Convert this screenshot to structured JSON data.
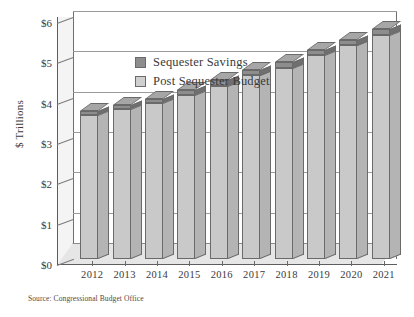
{
  "chart_data": {
    "type": "bar",
    "stacked": true,
    "title": "",
    "xlabel": "",
    "ylabel": "$ Trillions",
    "ylim": [
      0,
      6
    ],
    "ytick_values": [
      0,
      1,
      2,
      3,
      4,
      5,
      6
    ],
    "ytick_labels": [
      "$0",
      "$1",
      "$2",
      "$3",
      "$4",
      "$5",
      "$6"
    ],
    "grid": true,
    "legend_position": "upper-left",
    "categories": [
      "2012",
      "2013",
      "2014",
      "2015",
      "2016",
      "2017",
      "2018",
      "2019",
      "2020",
      "2021"
    ],
    "series": [
      {
        "name": "Post Sequester Budget",
        "color": "#c9c9c9",
        "values": [
          3.58,
          3.72,
          3.87,
          4.07,
          4.3,
          4.55,
          4.74,
          5.05,
          5.3,
          5.55
        ]
      },
      {
        "name": "Sequester Savings",
        "color": "#8d8d8d",
        "values": [
          0.09,
          0.1,
          0.11,
          0.13,
          0.15,
          0.14,
          0.14,
          0.13,
          0.14,
          0.15
        ]
      }
    ],
    "totals": [
      3.67,
      3.82,
      3.98,
      4.2,
      4.45,
      4.69,
      4.88,
      5.18,
      5.44,
      5.7
    ],
    "source_note": "Source: Congressional Budget Office"
  },
  "axis": {
    "y_title": "$ Trillions"
  },
  "legend": {
    "items": [
      {
        "label": "Sequester Savings",
        "swatch": "dark-gray-swatch"
      },
      {
        "label": "Post Sequester Budget",
        "swatch": "light-gray-swatch"
      }
    ]
  },
  "footer": {
    "source": "Source: Congressional Budget Office"
  }
}
